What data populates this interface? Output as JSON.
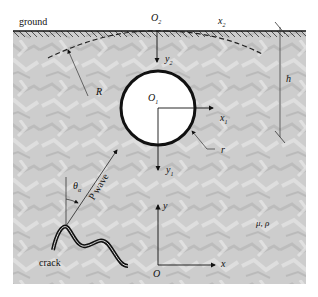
{
  "figure": {
    "type": "diagram",
    "labels": {
      "ground": "ground",
      "O2": "O",
      "O2_sub": "2",
      "x2": "x",
      "x2_sub": "2",
      "y2": "y",
      "y2_sub": "2",
      "O1": "O",
      "O1_sub": "1",
      "x1": "x",
      "x1_sub": "1",
      "y1": "y",
      "y1_sub": "1",
      "R": "R",
      "r": "r",
      "h": "h",
      "theta": "θ",
      "theta_sub": "α",
      "p_wave": "P wave",
      "crack": "crack",
      "medium": "μ, ρ",
      "O": "O",
      "x": "x",
      "y": "y"
    },
    "colors": {
      "rock_fill": "#cfcfcf",
      "line": "#111111",
      "cavity": "#ffffff"
    }
  }
}
